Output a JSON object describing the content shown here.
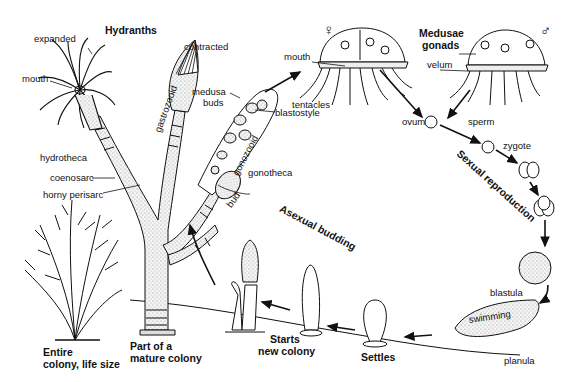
{
  "diagram": {
    "labels": {
      "hydranths": "Hydranths",
      "expanded": "expanded",
      "contracted": "contracted",
      "mouth_polyp": "mouth",
      "hydrotheca": "hydrotheca",
      "coenosarc": "coenosarc",
      "horny_perisarc": "horny perisarc",
      "gastrozooid": "gastrozooid",
      "medusa_buds_1": "medusa",
      "medusa_buds_2": "buds",
      "blastostyle": "blastostyle",
      "gonozooid": "gonozooid",
      "gonotheca": "gonotheca",
      "bud": "bud",
      "mouth_medusa": "mouth",
      "tentacles": "tentacles",
      "female_symbol": "♀",
      "male_symbol": "♂",
      "medusae": "Medusae",
      "gonads": "gonads",
      "velum": "velum",
      "ovum": "ovum",
      "sperm": "sperm",
      "zygote": "zygote",
      "sexual_reproduction": "Sexual reproduction",
      "blastula": "blastula",
      "swimming": "swimming",
      "planula": "planula",
      "settles": "Settles",
      "starts_new_colony_1": "Starts",
      "starts_new_colony_2": "new colony",
      "asexual_budding": "Asexual budding",
      "part_of_colony_1": "Part of a",
      "part_of_colony_2": "mature colony",
      "entire_colony_1": "Entire",
      "entire_colony_2": "colony, life size"
    },
    "colors": {
      "ink": "#111111",
      "stipple": "#d9d9d9",
      "background": "#ffffff"
    }
  }
}
